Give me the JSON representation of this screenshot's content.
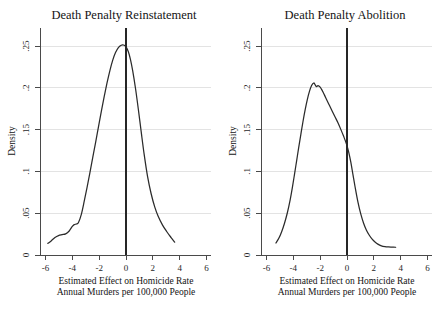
{
  "figure": {
    "background_color": "#ffffff",
    "curve_color": "#2b2b2b",
    "grid_color": "#e3e3e3",
    "axis_color": "#4a4a4a",
    "vline_color": "#262626"
  },
  "chart_data": [
    {
      "type": "line",
      "title": "Death Penalty Reinstatement",
      "xlabel": "Estimated Effect on Homicide Rate",
      "xlabel2": "Annual Murders per 100,000 People",
      "ylabel": "Density",
      "xlim": [
        -6,
        6
      ],
      "ylim": [
        0,
        0.2708
      ],
      "xticks": [
        -6,
        -4,
        -2,
        0,
        2,
        4,
        6
      ],
      "xtick_labels": [
        "-6",
        "-4",
        "-2",
        "0",
        "2",
        "4",
        "6"
      ],
      "yticks": [
        0,
        0.05,
        0.1,
        0.15,
        0.2,
        0.25
      ],
      "ytick_labels": [
        "0",
        ".05",
        ".1",
        ".15",
        ".2",
        ".25"
      ],
      "grid": true,
      "legend": "none",
      "reference_line_x": 0,
      "x": [
        -5.45,
        -5.2,
        -4.95,
        -4.7,
        -4.45,
        -4.2,
        -3.95,
        -3.75,
        -3.6,
        -3.45,
        -3.3,
        -3.1,
        -2.9,
        -2.7,
        -2.5,
        -2.3,
        -2.1,
        -1.9,
        -1.7,
        -1.5,
        -1.3,
        -1.1,
        -0.9,
        -0.7,
        -0.5,
        -0.3,
        -0.15,
        -0.05,
        0.05,
        0.2,
        0.35,
        0.5,
        0.7,
        0.9,
        1.1,
        1.3,
        1.55,
        1.8,
        2.05,
        2.3,
        2.6,
        2.9,
        3.2,
        3.45
      ],
      "y": [
        0.015,
        0.0185,
        0.0225,
        0.025,
        0.0262,
        0.0272,
        0.031,
        0.0365,
        0.0392,
        0.04,
        0.042,
        0.0525,
        0.069,
        0.087,
        0.106,
        0.1255,
        0.145,
        0.165,
        0.185,
        0.204,
        0.2215,
        0.2375,
        0.251,
        0.261,
        0.2675,
        0.2705,
        0.2708,
        0.27,
        0.268,
        0.262,
        0.252,
        0.238,
        0.215,
        0.188,
        0.159,
        0.131,
        0.101,
        0.079,
        0.062,
        0.0495,
        0.0385,
        0.03,
        0.0225,
        0.0165
      ],
      "annotations": [
        {
          "type": "vertical-reference-line",
          "x": 0,
          "label": "zero-effect-line"
        }
      ]
    },
    {
      "type": "line",
      "title": "Death Penalty Abolition",
      "xlabel": "Estimated Effect on Homicide Rate",
      "xlabel2": "Annual Murders per 100,000 People",
      "ylabel": "Density",
      "xlim": [
        -6,
        6
      ],
      "ylim": [
        0,
        0.2708
      ],
      "xticks": [
        -6,
        -4,
        -2,
        0,
        2,
        4,
        6
      ],
      "xtick_labels": [
        "-6",
        "-4",
        "-2",
        "0",
        "2",
        "4",
        "6"
      ],
      "yticks": [
        0,
        0.05,
        0.1,
        0.15,
        0.2,
        0.25
      ],
      "ytick_labels": [
        "0",
        ".05",
        ".1",
        ".15",
        ".2",
        ".25"
      ],
      "grid": true,
      "legend": "none",
      "reference_line_x": 0,
      "x": [
        -4.95,
        -4.75,
        -4.55,
        -4.35,
        -4.15,
        -3.95,
        -3.8,
        -3.65,
        -3.5,
        -3.35,
        -3.2,
        -3.05,
        -2.9,
        -2.75,
        -2.6,
        -2.45,
        -2.3,
        -2.2,
        -2.1,
        -2.0,
        -1.85,
        -1.7,
        -1.55,
        -1.4,
        -1.2,
        -1.0,
        -0.8,
        -0.6,
        -0.4,
        -0.2,
        0.0,
        0.15,
        0.3,
        0.45,
        0.6,
        0.8,
        1.0,
        1.2,
        1.4,
        1.6,
        1.8,
        2.0,
        2.2,
        2.45,
        2.7,
        2.95,
        3.2,
        3.45
      ],
      "y": [
        0.0155,
        0.0215,
        0.03,
        0.041,
        0.0545,
        0.0715,
        0.087,
        0.104,
        0.1215,
        0.139,
        0.156,
        0.1725,
        0.1875,
        0.2005,
        0.211,
        0.2185,
        0.2218,
        0.2195,
        0.217,
        0.2185,
        0.2165,
        0.212,
        0.2065,
        0.2005,
        0.193,
        0.1855,
        0.178,
        0.1705,
        0.162,
        0.153,
        0.143,
        0.133,
        0.12,
        0.104,
        0.088,
        0.0685,
        0.053,
        0.041,
        0.032,
        0.0255,
        0.0205,
        0.0168,
        0.014,
        0.0118,
        0.0108,
        0.0104,
        0.0102,
        0.01
      ],
      "annotations": [
        {
          "type": "vertical-reference-line",
          "x": 0,
          "label": "zero-effect-line"
        }
      ]
    }
  ]
}
